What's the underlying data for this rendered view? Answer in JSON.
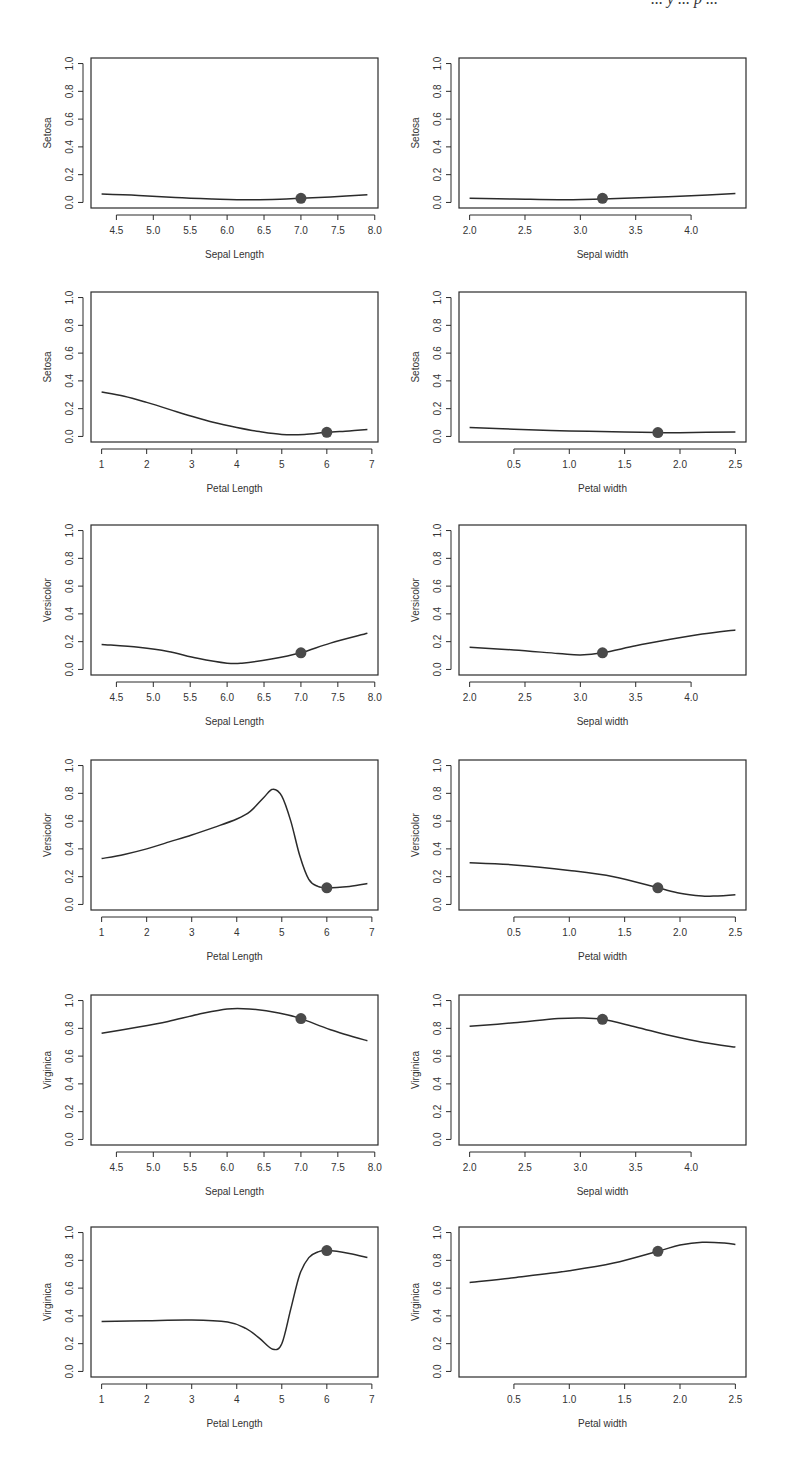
{
  "page": {
    "header_fragment": "... y ... p ..."
  },
  "chart_data": [
    {
      "id": "setosa-sepal-length",
      "type": "line",
      "ylabel": "Setosa",
      "xlabel": "Sepal Length",
      "xlim": [
        4.3,
        7.9
      ],
      "ylim": [
        0.0,
        1.0
      ],
      "xticks": [
        "4.5",
        "5.0",
        "5.5",
        "6.0",
        "6.5",
        "7.0",
        "7.5",
        "8.0"
      ],
      "xtick_values": [
        4.5,
        5.0,
        5.5,
        6.0,
        6.5,
        7.0,
        7.5,
        8.0
      ],
      "yticks": [
        "0.0",
        "0.2",
        "0.4",
        "0.6",
        "0.8",
        "1.0"
      ],
      "x": [
        4.3,
        4.8,
        5.3,
        5.8,
        6.3,
        6.8,
        7.0,
        7.4,
        7.9
      ],
      "y": [
        0.06,
        0.05,
        0.035,
        0.025,
        0.02,
        0.025,
        0.03,
        0.04,
        0.055
      ],
      "point": {
        "x": 7.0,
        "y": 0.03
      }
    },
    {
      "id": "setosa-sepal-width",
      "type": "line",
      "ylabel": "Setosa",
      "xlabel": "Sepal width",
      "xlim": [
        2.0,
        4.4
      ],
      "ylim": [
        0.0,
        1.0
      ],
      "xticks": [
        "2.0",
        "2.5",
        "3.0",
        "3.5",
        "4.0"
      ],
      "xtick_values": [
        2.0,
        2.5,
        3.0,
        3.5,
        4.0
      ],
      "yticks": [
        "0.0",
        "0.2",
        "0.4",
        "0.6",
        "0.8",
        "1.0"
      ],
      "x": [
        2.0,
        2.4,
        2.8,
        3.2,
        3.6,
        4.0,
        4.4
      ],
      "y": [
        0.03,
        0.025,
        0.02,
        0.025,
        0.035,
        0.048,
        0.065
      ],
      "point": {
        "x": 3.2,
        "y": 0.03
      }
    },
    {
      "id": "setosa-petal-length",
      "type": "line",
      "ylabel": "Setosa",
      "xlabel": "Petal Length",
      "xlim": [
        1.0,
        6.9
      ],
      "ylim": [
        0.0,
        1.0
      ],
      "xticks": [
        "1",
        "2",
        "3",
        "4",
        "5",
        "6",
        "7"
      ],
      "xtick_values": [
        1,
        2,
        3,
        4,
        5,
        6,
        7
      ],
      "yticks": [
        "0.0",
        "0.2",
        "0.4",
        "0.6",
        "0.8",
        "1.0"
      ],
      "x": [
        1.0,
        1.5,
        2.0,
        2.5,
        3.0,
        3.5,
        4.0,
        4.5,
        5.0,
        5.5,
        6.0,
        6.5,
        6.9
      ],
      "y": [
        0.32,
        0.29,
        0.245,
        0.195,
        0.145,
        0.1,
        0.065,
        0.035,
        0.015,
        0.015,
        0.03,
        0.04,
        0.05
      ],
      "point": {
        "x": 6.0,
        "y": 0.03
      }
    },
    {
      "id": "setosa-petal-width",
      "type": "line",
      "ylabel": "Setosa",
      "xlabel": "Petal width",
      "xlim": [
        0.1,
        2.5
      ],
      "ylim": [
        0.0,
        1.0
      ],
      "xticks": [
        "0.5",
        "1.0",
        "1.5",
        "2.0",
        "2.5"
      ],
      "xtick_values": [
        0.5,
        1.0,
        1.5,
        2.0,
        2.5
      ],
      "yticks": [
        "0.0",
        "0.2",
        "0.4",
        "0.6",
        "0.8",
        "1.0"
      ],
      "x": [
        0.1,
        0.5,
        1.0,
        1.5,
        1.8,
        2.0,
        2.5
      ],
      "y": [
        0.065,
        0.052,
        0.04,
        0.032,
        0.028,
        0.027,
        0.033
      ],
      "point": {
        "x": 1.8,
        "y": 0.028
      }
    },
    {
      "id": "versicolor-sepal-length",
      "type": "line",
      "ylabel": "Versicolor",
      "xlabel": "Sepal Length",
      "xlim": [
        4.3,
        7.9
      ],
      "ylim": [
        0.0,
        1.0
      ],
      "xticks": [
        "4.5",
        "5.0",
        "5.5",
        "6.0",
        "6.5",
        "7.0",
        "7.5",
        "8.0"
      ],
      "xtick_values": [
        4.5,
        5.0,
        5.5,
        6.0,
        6.5,
        7.0,
        7.5,
        8.0
      ],
      "yticks": [
        "0.0",
        "0.2",
        "0.4",
        "0.6",
        "0.8",
        "1.0"
      ],
      "x": [
        4.3,
        4.8,
        5.2,
        5.6,
        6.0,
        6.2,
        6.6,
        7.0,
        7.4,
        7.9
      ],
      "y": [
        0.18,
        0.16,
        0.13,
        0.08,
        0.045,
        0.045,
        0.075,
        0.12,
        0.19,
        0.26
      ],
      "point": {
        "x": 7.0,
        "y": 0.12
      }
    },
    {
      "id": "versicolor-sepal-width",
      "type": "line",
      "ylabel": "Versicolor",
      "xlabel": "Sepal width",
      "xlim": [
        2.0,
        4.4
      ],
      "ylim": [
        0.0,
        1.0
      ],
      "xticks": [
        "2.0",
        "2.5",
        "3.0",
        "3.5",
        "4.0"
      ],
      "xtick_values": [
        2.0,
        2.5,
        3.0,
        3.5,
        4.0
      ],
      "yticks": [
        "0.0",
        "0.2",
        "0.4",
        "0.6",
        "0.8",
        "1.0"
      ],
      "x": [
        2.0,
        2.4,
        2.8,
        3.0,
        3.2,
        3.5,
        3.8,
        4.1,
        4.4
      ],
      "y": [
        0.16,
        0.14,
        0.115,
        0.105,
        0.12,
        0.17,
        0.215,
        0.255,
        0.285
      ],
      "point": {
        "x": 3.2,
        "y": 0.12
      }
    },
    {
      "id": "versicolor-petal-length",
      "type": "line",
      "ylabel": "Versicolor",
      "xlabel": "Petal Length",
      "xlim": [
        1.0,
        6.9
      ],
      "ylim": [
        0.0,
        1.0
      ],
      "xticks": [
        "1",
        "2",
        "3",
        "4",
        "5",
        "6",
        "7"
      ],
      "xtick_values": [
        1,
        2,
        3,
        4,
        5,
        6,
        7
      ],
      "yticks": [
        "0.0",
        "0.2",
        "0.4",
        "0.6",
        "0.8",
        "1.0"
      ],
      "x": [
        1.0,
        1.5,
        2.0,
        2.5,
        3.0,
        3.5,
        4.0,
        4.3,
        4.6,
        4.8,
        5.0,
        5.2,
        5.4,
        5.6,
        5.8,
        6.0,
        6.5,
        6.9
      ],
      "y": [
        0.33,
        0.36,
        0.4,
        0.45,
        0.5,
        0.555,
        0.615,
        0.67,
        0.77,
        0.83,
        0.78,
        0.6,
        0.35,
        0.18,
        0.13,
        0.12,
        0.13,
        0.15
      ],
      "point": {
        "x": 6.0,
        "y": 0.12
      }
    },
    {
      "id": "versicolor-petal-width",
      "type": "line",
      "ylabel": "Versicolor",
      "xlabel": "Petal width",
      "xlim": [
        0.1,
        2.5
      ],
      "ylim": [
        0.0,
        1.0
      ],
      "xticks": [
        "0.5",
        "1.0",
        "1.5",
        "2.0",
        "2.5"
      ],
      "xtick_values": [
        0.5,
        1.0,
        1.5,
        2.0,
        2.5
      ],
      "yticks": [
        "0.0",
        "0.2",
        "0.4",
        "0.6",
        "0.8",
        "1.0"
      ],
      "x": [
        0.1,
        0.5,
        1.0,
        1.4,
        1.8,
        2.0,
        2.2,
        2.3,
        2.5
      ],
      "y": [
        0.3,
        0.285,
        0.245,
        0.2,
        0.12,
        0.08,
        0.06,
        0.06,
        0.07
      ],
      "point": {
        "x": 1.8,
        "y": 0.12
      }
    },
    {
      "id": "virginica-sepal-length",
      "type": "line",
      "ylabel": "Virginica",
      "xlabel": "Sepal Length",
      "xlim": [
        4.3,
        7.9
      ],
      "ylim": [
        0.0,
        1.0
      ],
      "xticks": [
        "4.5",
        "5.0",
        "5.5",
        "6.0",
        "6.5",
        "7.0",
        "7.5",
        "8.0"
      ],
      "xtick_values": [
        4.5,
        5.0,
        5.5,
        6.0,
        6.5,
        7.0,
        7.5,
        8.0
      ],
      "yticks": [
        "0.0",
        "0.2",
        "0.4",
        "0.6",
        "0.8",
        "1.0"
      ],
      "x": [
        4.3,
        4.8,
        5.2,
        5.6,
        6.0,
        6.3,
        6.7,
        7.0,
        7.4,
        7.9
      ],
      "y": [
        0.765,
        0.81,
        0.85,
        0.9,
        0.94,
        0.94,
        0.91,
        0.87,
        0.79,
        0.71
      ],
      "point": {
        "x": 7.0,
        "y": 0.87
      }
    },
    {
      "id": "virginica-sepal-width",
      "type": "line",
      "ylabel": "Virginica",
      "xlabel": "Sepal width",
      "xlim": [
        2.0,
        4.4
      ],
      "ylim": [
        0.0,
        1.0
      ],
      "xticks": [
        "2.0",
        "2.5",
        "3.0",
        "3.5",
        "4.0"
      ],
      "xtick_values": [
        2.0,
        2.5,
        3.0,
        3.5,
        4.0
      ],
      "yticks": [
        "0.0",
        "0.2",
        "0.4",
        "0.6",
        "0.8",
        "1.0"
      ],
      "x": [
        2.0,
        2.4,
        2.8,
        3.0,
        3.2,
        3.5,
        3.8,
        4.1,
        4.4
      ],
      "y": [
        0.815,
        0.84,
        0.87,
        0.875,
        0.865,
        0.81,
        0.75,
        0.7,
        0.665
      ],
      "point": {
        "x": 3.2,
        "y": 0.865
      }
    },
    {
      "id": "virginica-petal-length",
      "type": "line",
      "ylabel": "Virginica",
      "xlabel": "Petal Length",
      "xlim": [
        1.0,
        6.9
      ],
      "ylim": [
        0.0,
        1.0
      ],
      "xticks": [
        "1",
        "2",
        "3",
        "4",
        "5",
        "6",
        "7"
      ],
      "xtick_values": [
        1,
        2,
        3,
        4,
        5,
        6,
        7
      ],
      "yticks": [
        "0.0",
        "0.2",
        "0.4",
        "0.6",
        "0.8",
        "1.0"
      ],
      "x": [
        1.0,
        2.0,
        3.0,
        3.8,
        4.2,
        4.5,
        4.8,
        5.0,
        5.2,
        5.4,
        5.6,
        5.8,
        6.0,
        6.5,
        6.9
      ],
      "y": [
        0.36,
        0.365,
        0.37,
        0.355,
        0.31,
        0.24,
        0.16,
        0.2,
        0.45,
        0.7,
        0.82,
        0.86,
        0.87,
        0.85,
        0.82
      ],
      "point": {
        "x": 6.0,
        "y": 0.87
      }
    },
    {
      "id": "virginica-petal-width",
      "type": "line",
      "ylabel": "Virginica",
      "xlabel": "Petal width",
      "xlim": [
        0.1,
        2.5
      ],
      "ylim": [
        0.0,
        1.0
      ],
      "xticks": [
        "0.5",
        "1.0",
        "1.5",
        "2.0",
        "2.5"
      ],
      "xtick_values": [
        0.5,
        1.0,
        1.5,
        2.0,
        2.5
      ],
      "yticks": [
        "0.0",
        "0.2",
        "0.4",
        "0.6",
        "0.8",
        "1.0"
      ],
      "x": [
        0.1,
        0.5,
        1.0,
        1.4,
        1.8,
        2.0,
        2.2,
        2.4,
        2.5
      ],
      "y": [
        0.64,
        0.675,
        0.725,
        0.78,
        0.865,
        0.91,
        0.93,
        0.925,
        0.915
      ],
      "point": {
        "x": 1.8,
        "y": 0.865
      }
    }
  ],
  "style": {
    "line_color": "#2b2b2b",
    "point_color": "#4a4a4a",
    "frame_color": "#2b2b2b",
    "background": "#ffffff"
  }
}
